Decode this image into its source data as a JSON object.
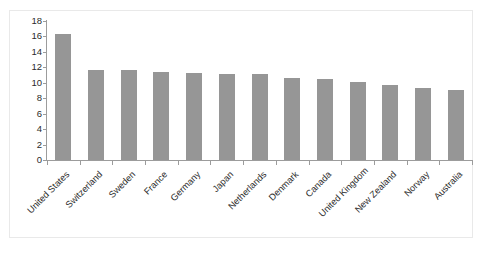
{
  "chart_data": {
    "type": "bar",
    "title": "",
    "subtitle": "",
    "xlabel": "",
    "ylabel": "",
    "ylim": [
      0,
      18
    ],
    "ytick_step": 2,
    "yticks": [
      0,
      2,
      4,
      6,
      8,
      10,
      12,
      14,
      16,
      18
    ],
    "grid": false,
    "legend": "none",
    "bar_color": "#969696",
    "axis_color": "#9c9c9c",
    "text_color": "#2b2b2b",
    "categories": [
      "United States",
      "Switzerland",
      "Sweden",
      "France",
      "Germany",
      "Japan",
      "Netherlands",
      "Denmark",
      "Canada",
      "United Kingdom",
      "New Zealand",
      "Norway",
      "Australia"
    ],
    "values": [
      16.3,
      11.6,
      11.6,
      11.4,
      11.3,
      11.2,
      11.1,
      10.6,
      10.5,
      10.1,
      9.7,
      9.3,
      9.1
    ]
  }
}
